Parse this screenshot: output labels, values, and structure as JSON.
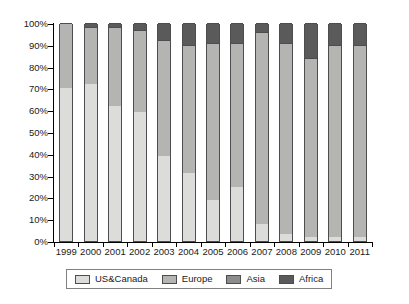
{
  "chart_data": {
    "type": "bar",
    "subtype": "stacked-100-percent",
    "title": "",
    "xlabel": "",
    "ylabel": "",
    "ylim": [
      0,
      100
    ],
    "yticks": [
      "0%",
      "10%",
      "20%",
      "30%",
      "40%",
      "50%",
      "60%",
      "70%",
      "80%",
      "90%",
      "100%"
    ],
    "ytick_values": [
      0,
      10,
      20,
      30,
      40,
      50,
      60,
      70,
      80,
      90,
      100
    ],
    "grid": false,
    "legend_position": "bottom",
    "categories": [
      "1999",
      "2000",
      "2001",
      "2002",
      "2003",
      "2004",
      "2005",
      "2006",
      "2007",
      "2008",
      "2009",
      "2010",
      "2011"
    ],
    "series": [
      {
        "name": "US&Canada",
        "color": "#dcdcda",
        "values": [
          70,
          72,
          62,
          59,
          39,
          31,
          19,
          25,
          8,
          3,
          2,
          2,
          2
        ]
      },
      {
        "name": "Europe",
        "color": "#b4b4b2",
        "values": [
          30,
          26,
          36,
          38,
          53,
          59,
          72,
          66,
          88,
          88,
          82,
          88,
          88
        ]
      },
      {
        "name": "Asia",
        "color": "#8c8c8c",
        "values": [
          0,
          0,
          0,
          0,
          0,
          0,
          0,
          0,
          0,
          0,
          0,
          0,
          0
        ]
      },
      {
        "name": "Africa",
        "color": "#5a5a5a",
        "values": [
          0,
          2,
          2,
          3,
          8,
          10,
          9,
          9,
          4,
          9,
          16,
          10,
          10
        ]
      }
    ]
  },
  "legend": {
    "items": [
      {
        "label": "US&Canada",
        "color": "#dcdcda"
      },
      {
        "label": "Europe",
        "color": "#b4b4b2"
      },
      {
        "label": "Asia",
        "color": "#8c8c8c"
      },
      {
        "label": "Africa",
        "color": "#5a5a5a"
      }
    ]
  }
}
